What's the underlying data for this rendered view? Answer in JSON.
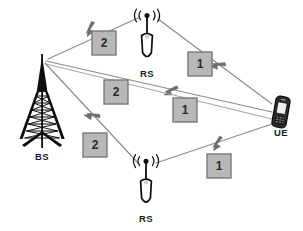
{
  "diagram": {
    "background_color": "#ffffff",
    "link_color": "#8c8c8c",
    "node_color": "#111111",
    "hop_box": {
      "fill": "#b8b8b8",
      "border": "#7a7a7a",
      "text_color": "#2b2b2b"
    },
    "nodes": [
      {
        "id": "bs",
        "label": "BS",
        "icon": "tower-icon",
        "x": 42,
        "y": 98,
        "label_x": 42,
        "label_y": 160
      },
      {
        "id": "rs_top",
        "label": "RS",
        "icon": "relay-station-icon",
        "x": 147,
        "y": 40,
        "label_x": 147,
        "label_y": 77
      },
      {
        "id": "rs_bottom",
        "label": "RS",
        "icon": "relay-station-icon",
        "x": 146,
        "y": 186,
        "label_x": 146,
        "label_y": 222
      },
      {
        "id": "ue",
        "label": "UE",
        "icon": "mobile-phone-icon",
        "x": 281,
        "y": 113,
        "label_x": 281,
        "label_y": 136
      }
    ],
    "links": [
      {
        "id": "bs-to-rs-top",
        "from": "bs",
        "to": "rs_top",
        "hop_label": "2",
        "hop_x": 105,
        "hop_y": 44,
        "arrow_x": 86,
        "arrow_y": 30,
        "x1": 48,
        "y1": 59,
        "x2": 138,
        "y2": 18
      },
      {
        "id": "rs-top-to-ue",
        "from": "rs_top",
        "to": "ue",
        "hop_label": "1",
        "hop_x": 200,
        "hop_y": 64,
        "arrow_x": 213,
        "arrow_y": 55,
        "x1": 158,
        "y1": 19,
        "x2": 272,
        "y2": 104
      },
      {
        "id": "bs-to-ue-upper",
        "from": "bs",
        "to": "ue",
        "hop_label": "2",
        "hop_x": 116,
        "hop_y": 92,
        "arrow_x": 160,
        "arrow_y": 88,
        "x1": 46,
        "y1": 60,
        "x2": 272,
        "y2": 112
      },
      {
        "id": "bs-to-ue-lower",
        "from": "bs",
        "to": "ue",
        "hop_label": "1",
        "hop_x": 185,
        "hop_y": 110,
        "arrow_x": 150,
        "arrow_y": 100,
        "x1": 46,
        "y1": 62,
        "x2": 272,
        "y2": 117
      },
      {
        "id": "bs-to-rs-bottom",
        "from": "bs",
        "to": "rs_bottom",
        "hop_label": "2",
        "hop_x": 95,
        "hop_y": 145,
        "arrow_x": 89,
        "arrow_y": 112,
        "x1": 45,
        "y1": 62,
        "x2": 140,
        "y2": 164
      },
      {
        "id": "rs-bottom-to-ue",
        "from": "rs_bottom",
        "to": "ue",
        "hop_label": "1",
        "hop_x": 219,
        "hop_y": 166,
        "arrow_x": 212,
        "arrow_y": 145,
        "x1": 156,
        "y1": 163,
        "x2": 272,
        "y2": 124
      }
    ]
  }
}
